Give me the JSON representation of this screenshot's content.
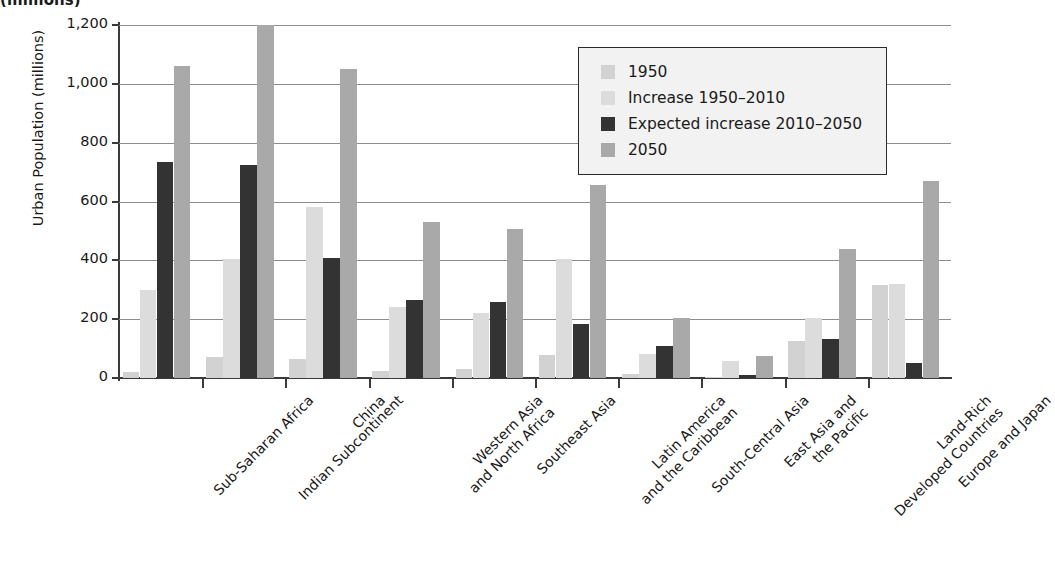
{
  "title_fragment": "(millions)",
  "chart_data": {
    "type": "bar",
    "title": "",
    "xlabel": "",
    "ylabel": "Urban Population (millions)",
    "ylim": [
      0,
      1200
    ],
    "ytick_values": [
      0,
      200,
      400,
      600,
      800,
      1000,
      1200
    ],
    "ytick_labels": [
      "0",
      "200",
      "400",
      "600",
      "800",
      "1,000",
      "1,200"
    ],
    "grid": true,
    "legend_position": "upper right",
    "categories": [
      "Sub-Saharan Africa",
      "Indian Subcontinent",
      "China",
      "Western Asia\nand North Africa",
      "Southeast Asia",
      "Latin America\nand the Caribbean",
      "South-Central Asia",
      "East Asia and\nthe Pacific",
      "Land-Rich\nDeveloped Countries",
      "Europe and Japan"
    ],
    "series": [
      {
        "name": "1950",
        "color": "#d2d2d2",
        "values": [
          20,
          70,
          65,
          25,
          30,
          78,
          15,
          3,
          125,
          315
        ]
      },
      {
        "name": "Increase 1950–2010",
        "color": "#dcdcdc",
        "values": [
          300,
          405,
          580,
          240,
          220,
          405,
          80,
          58,
          205,
          318
        ]
      },
      {
        "name": "Expected increase 2010–2050",
        "color": "#333333",
        "values": [
          735,
          725,
          408,
          265,
          260,
          185,
          110,
          10,
          133,
          52
        ]
      },
      {
        "name": "2050",
        "color": "#a9a9a9",
        "values": [
          1060,
          1215,
          1050,
          530,
          505,
          655,
          205,
          75,
          440,
          670
        ]
      }
    ]
  },
  "legend": {
    "items": [
      {
        "label": "1950",
        "color": "#d2d2d2"
      },
      {
        "label": "Increase 1950–2010",
        "color": "#dcdcdc"
      },
      {
        "label": "Expected increase 2010–2050",
        "color": "#333333"
      },
      {
        "label": "2050",
        "color": "#a9a9a9"
      }
    ]
  }
}
